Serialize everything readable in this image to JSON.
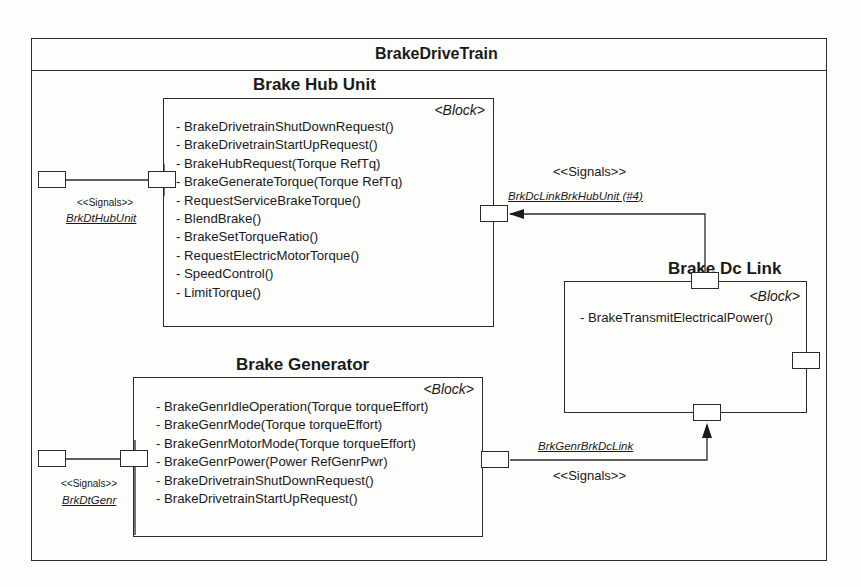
{
  "diagram": {
    "title": "BrakeDriveTrain",
    "blocks": [
      {
        "id": "brake-hub-unit",
        "name": "Brake Hub Unit",
        "stereotype": "<Block>",
        "operations": [
          "- BrakeDrivetrainShutDownRequest()",
          "- BrakeDrivetrainStartUpRequest()",
          "- BrakeHubRequest(Torque RefTq)",
          "- BrakeGenerateTorque(Torque RefTq)",
          "- RequestServiceBrakeTorque()",
          "- BlendBrake()",
          "- BrakeSetTorqueRatio()",
          "- RequestElectricMotorTorque()",
          "- SpeedControl()",
          "- LimitTorque()"
        ]
      },
      {
        "id": "brake-generator",
        "name": "Brake Generator",
        "stereotype": "<Block>",
        "operations": [
          "- BrakeGenrIdleOperation(Torque torqueEffort)",
          "- BrakeGenrMode(Torque torqueEffort)",
          "- BrakeGenrMotorMode(Torque torqueEffort)",
          "- BrakeGenrPower(Power RefGenrPwr)",
          "- BrakeDrivetrainShutDownRequest()",
          "- BrakeDrivetrainStartUpRequest()"
        ]
      },
      {
        "id": "brake-dc-link",
        "name": "Brake Dc Link",
        "stereotype": "<Block>",
        "operations": [
          "- BrakeTransmitElectricalPower()"
        ]
      }
    ],
    "connectors": [
      {
        "stereotype": "<<Signals>>",
        "name": "BrkDtHubUnit"
      },
      {
        "stereotype": "<<Signals>>",
        "name": "BrkDcLinkBrkHubUnit (#4)"
      },
      {
        "stereotype": "<<Signals>>",
        "name": "BrkDtGenr"
      },
      {
        "stereotype": "<<Signals>>",
        "name": "BrkGenrBrkDcLink"
      }
    ]
  }
}
